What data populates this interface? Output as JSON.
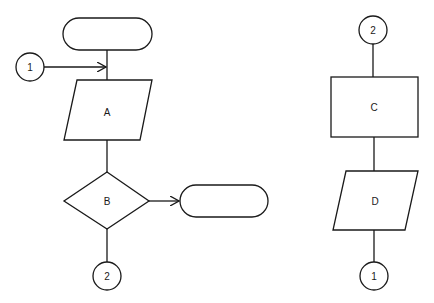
{
  "diagram": {
    "left_flow": {
      "start_terminal": {
        "label": ""
      },
      "entry_connector": {
        "label": "1"
      },
      "process_a": {
        "label": "A",
        "shape": "parallelogram"
      },
      "decision_b": {
        "label": "B",
        "shape": "diamond"
      },
      "exit_terminal": {
        "label": ""
      },
      "exit_connector": {
        "label": "2"
      }
    },
    "right_flow": {
      "entry_connector": {
        "label": "2"
      },
      "process_c": {
        "label": "C",
        "shape": "rectangle"
      },
      "process_d": {
        "label": "D",
        "shape": "parallelogram"
      },
      "exit_connector": {
        "label": "1"
      }
    },
    "colors": {
      "stroke": "#1a1a1a",
      "background": "#ffffff"
    }
  }
}
